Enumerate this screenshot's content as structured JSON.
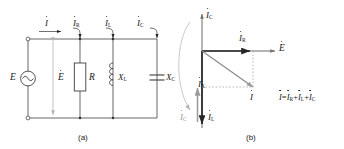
{
  "figure": {
    "caption_a": "(a)",
    "caption_b": "(b)",
    "colors": {
      "wire": "#4d4d4d",
      "phasor_black": "#262626",
      "phasor_gray": "#9a9a9a",
      "dashed": "#9a9a9a",
      "text": "#1a1a1a"
    }
  },
  "circuit": {
    "title": "parallel RLC circuit driven by AC voltage source",
    "source": {
      "label": "E",
      "symbol": "ac-source-sine",
      "phasor_label": "E",
      "phasor_has_dot": true
    },
    "branch_currents": [
      {
        "label": "I",
        "subscript": "",
        "has_dot": true,
        "name": "total-current"
      },
      {
        "label": "I",
        "subscript": "R",
        "has_dot": true,
        "name": "resistor-current"
      },
      {
        "label": "I",
        "subscript": "L",
        "has_dot": true,
        "name": "inductor-current"
      },
      {
        "label": "I",
        "subscript": "C",
        "has_dot": true,
        "name": "capacitor-current"
      }
    ],
    "components": [
      {
        "label": "R",
        "subscript": "",
        "type": "resistor"
      },
      {
        "label": "X",
        "subscript": "L",
        "type": "inductor"
      },
      {
        "label": "X",
        "subscript": "C",
        "type": "capacitor"
      }
    ]
  },
  "phasor": {
    "title": "phasor diagram of the parallel RLC circuit",
    "axis_labels": [
      {
        "label": "E",
        "subscript": "",
        "has_dot": true,
        "name": "voltage-axis-label"
      },
      {
        "label": "I",
        "subscript": "C",
        "has_dot": true,
        "name": "ic-axis-label"
      }
    ],
    "vectors": [
      {
        "label": "I",
        "subscript": "R",
        "has_dot": true,
        "direction": "right",
        "color": "#262626",
        "name": "ir-vector"
      },
      {
        "label": "I",
        "subscript": "L",
        "has_dot": true,
        "direction": "down",
        "color": "#262626",
        "name": "il-vector"
      },
      {
        "label": "I",
        "subscript": "C",
        "has_dot": true,
        "direction": "up",
        "color": "#9a9a9a",
        "name": "ic-vector"
      },
      {
        "label": "I",
        "subscript": "X",
        "has_dot": true,
        "direction": "down-resultant",
        "color": "#262626",
        "name": "ix-vector"
      },
      {
        "label": "I",
        "subscript": "",
        "has_dot": true,
        "direction": "diagonal-down-right",
        "color": "#8a8a8a",
        "name": "i-resultant-vector"
      }
    ],
    "equation": {
      "lhs": {
        "label": "I",
        "subscript": "",
        "has_dot": true
      },
      "eq": "=",
      "terms": [
        {
          "label": "I",
          "subscript": "R",
          "has_dot": true
        },
        {
          "label": "I",
          "subscript": "L",
          "has_dot": true
        },
        {
          "label": "I",
          "subscript": "C",
          "has_dot": true
        }
      ],
      "plus": "+",
      "text": "I = I R + I L + I C"
    }
  }
}
